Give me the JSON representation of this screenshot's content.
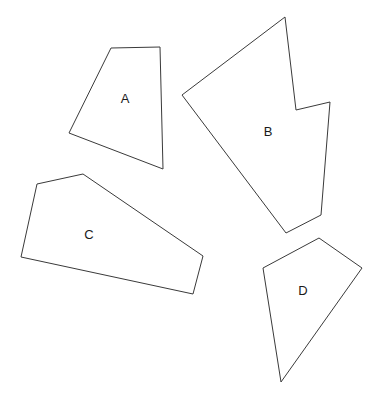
{
  "figure": {
    "background_color": "#ffffff",
    "stroke_color": "#3a3a3a",
    "label_color": "#1a1a1a",
    "width": 379,
    "height": 402,
    "shapes": [
      {
        "id": "shape-a",
        "label": "A",
        "sides": 4,
        "label_position": {
          "x": 125,
          "y": 100
        },
        "points": "111,48 160,47 163,169 69,133"
      },
      {
        "id": "shape-b",
        "label": "B",
        "sides": 7,
        "label_position": {
          "x": 268,
          "y": 133
        },
        "points": "285,17 296,110 330,102 321,215 286,233 182,95"
      },
      {
        "id": "shape-c",
        "label": "C",
        "sides": 5,
        "label_position": {
          "x": 89,
          "y": 236
        },
        "points": "37,184 83,174 203,256 193,294 21,257"
      },
      {
        "id": "shape-d",
        "label": "D",
        "sides": 4,
        "label_position": {
          "x": 303,
          "y": 292
        },
        "points": "319,238 362,268 281,382 263,268"
      }
    ]
  }
}
